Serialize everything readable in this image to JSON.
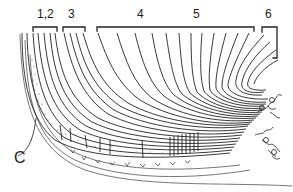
{
  "figure": {
    "type": "line drawing",
    "labels": {
      "group_1_2": "1,2",
      "group_3": "3",
      "group_4": "4",
      "group_5": "5",
      "group_6": "6",
      "corner": "C"
    },
    "colors": {
      "ink": "#222222",
      "background": "#ffffff"
    }
  }
}
